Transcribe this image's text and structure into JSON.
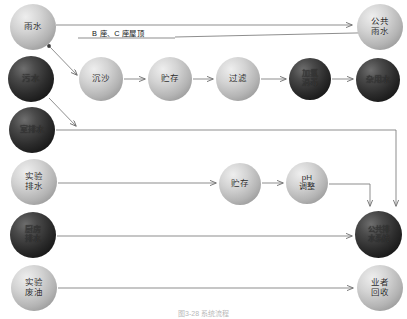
{
  "figure": {
    "caption": "图3-28  系统流程",
    "background_color": "#ffffff",
    "line_color": "#7a7a7a",
    "width": 407,
    "height": 319
  },
  "nodes": [
    {
      "id": "rainwater",
      "label": "雨水",
      "style": "light",
      "x": 10,
      "y": 4,
      "size": 46
    },
    {
      "id": "public-rainwater",
      "label": "公共\n雨水",
      "style": "light",
      "x": 357,
      "y": 4,
      "size": 46
    },
    {
      "id": "sewage",
      "label": "污水",
      "style": "dark",
      "x": 8,
      "y": 56,
      "size": 46
    },
    {
      "id": "sedimentation",
      "label": "沉沙",
      "style": "light",
      "x": 79,
      "y": 57,
      "size": 44
    },
    {
      "id": "storage-1",
      "label": "贮存",
      "style": "light",
      "x": 148,
      "y": 57,
      "size": 44
    },
    {
      "id": "filtration",
      "label": "过滤",
      "style": "light",
      "x": 216,
      "y": 57,
      "size": 44
    },
    {
      "id": "chlorination",
      "label": "加氯\n消毒",
      "style": "dark",
      "x": 289,
      "y": 58,
      "size": 42
    },
    {
      "id": "utility-water",
      "label": "杂用水",
      "style": "dark",
      "x": 356,
      "y": 58,
      "size": 44
    },
    {
      "id": "indoor-drainage",
      "label": "室排水",
      "style": "dark",
      "x": 9,
      "y": 107,
      "size": 46
    },
    {
      "id": "lab-drainage",
      "label": "实验\n排水",
      "style": "light",
      "x": 11,
      "y": 159,
      "size": 46
    },
    {
      "id": "storage-2",
      "label": "贮存",
      "style": "light",
      "x": 219,
      "y": 163,
      "size": 42
    },
    {
      "id": "ph-adjustment",
      "label": "pH\n调整",
      "style": "light",
      "x": 286,
      "y": 162,
      "size": 42
    },
    {
      "id": "kitchen-drainage",
      "label": "厨房\n排水",
      "style": "dark",
      "x": 10,
      "y": 212,
      "size": 46
    },
    {
      "id": "public-sewer",
      "label": "公共排\n水系统",
      "style": "dark",
      "x": 355,
      "y": 211,
      "size": 47
    },
    {
      "id": "lab-waste-oil",
      "label": "实验\n废油",
      "style": "light",
      "x": 11,
      "y": 265,
      "size": 46
    },
    {
      "id": "contractor",
      "label": "业者\n回收",
      "style": "light",
      "x": 357,
      "y": 265,
      "size": 46
    }
  ],
  "edge_labels": [
    {
      "id": "building-roof",
      "text": "B 座、C 座屋顶",
      "x": 92,
      "y": 31
    }
  ],
  "edges": [
    {
      "from": "rainwater",
      "to": "public-rainwater",
      "arrow": true
    },
    {
      "from": "rainwater",
      "to": "sedimentation",
      "arrow": true
    },
    {
      "from": "sewage",
      "to": "sedimentation",
      "arrow": true
    },
    {
      "from": "sedimentation",
      "to": "storage-1",
      "arrow": true
    },
    {
      "from": "storage-1",
      "to": "filtration",
      "arrow": true
    },
    {
      "from": "filtration",
      "to": "chlorination",
      "arrow": true
    },
    {
      "from": "chlorination",
      "to": "utility-water",
      "arrow": true
    },
    {
      "from": "sewage",
      "to": "indoor-drainage",
      "arrow": true
    },
    {
      "from": "indoor-drainage",
      "to": "public-sewer",
      "arrow": true
    },
    {
      "from": "lab-drainage",
      "to": "storage-2",
      "arrow": true
    },
    {
      "from": "storage-2",
      "to": "ph-adjustment",
      "arrow": true
    },
    {
      "from": "ph-adjustment",
      "to": "public-sewer",
      "arrow": true
    },
    {
      "from": "kitchen-drainage",
      "to": "public-sewer",
      "arrow": true
    },
    {
      "from": "lab-waste-oil",
      "to": "contractor",
      "arrow": true
    }
  ]
}
